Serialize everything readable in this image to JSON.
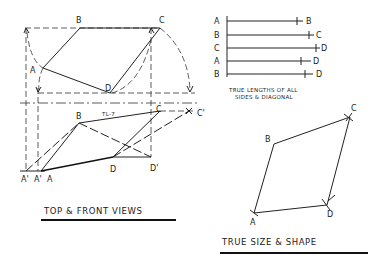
{
  "top_view": {
    "labels": {
      "A": "A",
      "B": "B",
      "C": "C",
      "D": "D"
    },
    "fold_label": "TL-7"
  },
  "front_view": {
    "labels": {
      "A": "A",
      "A_prime_1": "A'",
      "A_prime_2": "A'",
      "B": "B",
      "C": "C",
      "C_prime": "C'",
      "D": "D",
      "D_prime": "D'"
    }
  },
  "true_lengths": {
    "rows": [
      {
        "start": "A",
        "end": "B"
      },
      {
        "start": "B",
        "end": "C"
      },
      {
        "start": "C",
        "end": "D"
      },
      {
        "start": "A",
        "end": "D"
      },
      {
        "start": "B",
        "end": "D"
      }
    ],
    "caption_line1": "TRUE LENGTHS OF ALL",
    "caption_line2": "SIDES & DIAGONAL"
  },
  "true_shape": {
    "labels": {
      "A": "A",
      "B": "B",
      "C": "C",
      "D": "D"
    }
  },
  "captions": {
    "views": "TOP & FRONT VIEWS",
    "true_size": "TRUE SIZE & SHAPE"
  }
}
